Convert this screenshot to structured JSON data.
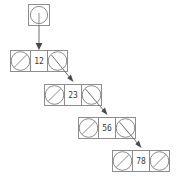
{
  "diagram": {
    "type": "linked-list",
    "canvas": {
      "width": 182,
      "height": 180,
      "background": "#ffffff"
    },
    "colors": {
      "stroke": "#8d8d8d",
      "link": "#6f6f6f",
      "arrow": "#4a4a4a",
      "text": "#3a3a3a",
      "fill": "#ffffff"
    },
    "head": {
      "label": "head-pointer",
      "x": 28,
      "y": 4,
      "size": 22,
      "pointer_icon": "circle-with-line"
    },
    "nodes": [
      {
        "value": "12",
        "x": 10,
        "y": 50,
        "width": 58,
        "height": 22,
        "left_pointer": "null",
        "right_pointer": "link",
        "order": 1
      },
      {
        "value": "23",
        "x": 44,
        "y": 84,
        "width": 58,
        "height": 22,
        "left_pointer": "null",
        "right_pointer": "link",
        "order": 2
      },
      {
        "value": "56",
        "x": 78,
        "y": 117,
        "width": 58,
        "height": 22,
        "left_pointer": "null",
        "right_pointer": "link",
        "order": 3
      },
      {
        "value": "78",
        "x": 112,
        "y": 150,
        "width": 58,
        "height": 22,
        "left_pointer": "null",
        "right_pointer": "null",
        "order": 4
      }
    ],
    "links": [
      {
        "name": "head-to-node-12",
        "from": "head",
        "to": "12",
        "style": "vertical-arrow"
      },
      {
        "name": "node-12-to-node-23",
        "from": "12",
        "to": "23",
        "style": "diagonal-arrow"
      },
      {
        "name": "node-23-to-node-56",
        "from": "23",
        "to": "56",
        "style": "diagonal-arrow"
      },
      {
        "name": "node-56-to-node-78",
        "from": "56",
        "to": "78",
        "style": "diagonal-arrow"
      }
    ]
  }
}
